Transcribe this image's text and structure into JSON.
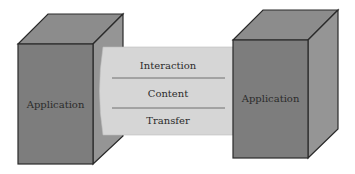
{
  "diagram": {
    "left_box": {
      "label": "Application"
    },
    "right_box": {
      "label": "Application"
    },
    "channel": {
      "layers": [
        {
          "label": "Interaction"
        },
        {
          "label": "Content"
        },
        {
          "label": "Transfer"
        }
      ]
    }
  },
  "colors": {
    "box_front": "#7d7d7d",
    "box_top": "#8c8c8c",
    "box_side": "#959595",
    "channel_fill": "#d6d6d6",
    "outline": "#2a2a2a",
    "text": "#2b2b2b"
  }
}
